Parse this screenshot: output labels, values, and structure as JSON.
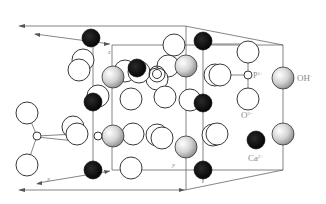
{
  "diagram": {
    "legend": [
      {
        "symbol": "small-open-circle",
        "label": "P5+",
        "text": "P",
        "sup": "5+"
      },
      {
        "symbol": "grey-sphere",
        "label": "OH-",
        "text": "OH",
        "sup": "−"
      },
      {
        "symbol": "open-circle",
        "label": "O2-",
        "text": "O",
        "sup": "2−"
      },
      {
        "symbol": "black-circle",
        "label": "Ca2+",
        "text": "Ca",
        "sup": "2+"
      }
    ],
    "axes": {
      "z": "z",
      "x": "x",
      "y": "y"
    },
    "colors": {
      "calcium": "#111111",
      "oxygen": "#ffffff",
      "hydroxyl": "#c8c8c8",
      "line": "#555555",
      "label": "#8a8a8a"
    }
  }
}
